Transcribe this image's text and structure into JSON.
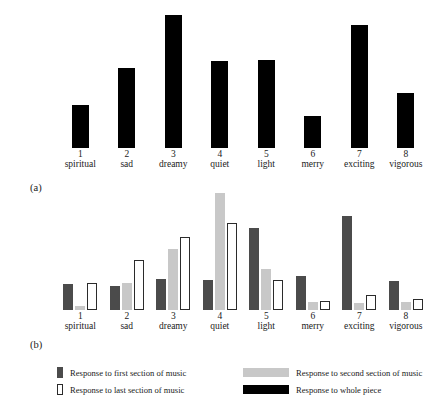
{
  "figure": {
    "panel_a_caption": "(a)",
    "panel_b_caption": "(b)"
  },
  "legend": {
    "items": [
      {
        "key": "first",
        "label": "Response to first section of music",
        "color": "#4b4b4b",
        "swatch": "narrow-filled"
      },
      {
        "key": "second",
        "label": "Response to second section of music",
        "color": "#c8c8c8",
        "swatch": "wide-filled"
      },
      {
        "key": "last",
        "label": "Response to last section of music",
        "color": "#ffffff",
        "swatch": "narrow-outline"
      },
      {
        "key": "whole",
        "label": "Response to whole piece",
        "color": "#000000",
        "swatch": "wide-filled"
      }
    ]
  },
  "chart_data": [
    {
      "id": "panel-a",
      "type": "bar",
      "title": "",
      "xlabel": "",
      "ylabel": "",
      "grid": false,
      "legend_position": "shared-bottom",
      "categories": [
        "1 spiritual",
        "2 sad",
        "3 dreamy",
        "4 quiet",
        "5 light",
        "6 merry",
        "7 exciting",
        "8 vigorous"
      ],
      "category_numbers": [
        "1",
        "2",
        "3",
        "4",
        "5",
        "6",
        "7",
        "8"
      ],
      "category_names": [
        "spiritual",
        "sad",
        "dreamy",
        "quiet",
        "light",
        "merry",
        "exciting",
        "vigorous"
      ],
      "series": [
        {
          "name": "Response to whole piece",
          "key": "whole",
          "color": "#000000",
          "values": [
            32,
            60,
            99,
            65,
            66,
            24,
            92,
            41
          ]
        }
      ],
      "ylim": [
        0,
        100
      ]
    },
    {
      "id": "panel-b",
      "type": "bar",
      "title": "",
      "xlabel": "",
      "ylabel": "",
      "grid": false,
      "legend_position": "shared-bottom",
      "categories": [
        "1 spiritual",
        "2 sad",
        "3 dreamy",
        "4 quiet",
        "5 light",
        "6 merry",
        "7 exciting",
        "8 vigorous"
      ],
      "category_numbers": [
        "1",
        "2",
        "3",
        "4",
        "5",
        "6",
        "7",
        "8"
      ],
      "category_names": [
        "spiritual",
        "sad",
        "dreamy",
        "quiet",
        "light",
        "merry",
        "exciting",
        "vigorous"
      ],
      "series": [
        {
          "name": "Response to first section of music",
          "key": "first",
          "color": "#4b4b4b",
          "values": [
            26,
            24,
            31,
            30,
            83,
            34,
            95,
            29
          ]
        },
        {
          "name": "Response to second section of music",
          "key": "second",
          "color": "#c8c8c8",
          "values": [
            4,
            27,
            62,
            118,
            41,
            8,
            7,
            8
          ]
        },
        {
          "name": "Response to last section of music",
          "key": "last",
          "color": "#ffffff",
          "values": [
            27,
            50,
            74,
            88,
            30,
            9,
            15,
            11
          ]
        }
      ],
      "ylim": [
        0,
        125
      ]
    }
  ]
}
